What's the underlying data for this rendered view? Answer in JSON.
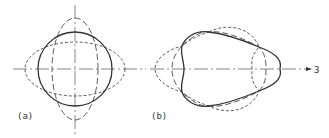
{
  "figure": {
    "colors": {
      "stroke": "#333333",
      "light_stroke": "#555555",
      "background": "#ffffff"
    },
    "panels": [
      {
        "id": "a",
        "label": "(a)",
        "description": "circle with orthogonal elliptical modes (mode 2)",
        "center": [
          75,
          69
        ]
      },
      {
        "id": "b",
        "label": "(b)",
        "description": "trilobe mode shape (mode 3)",
        "center": [
          230,
          69
        ]
      }
    ],
    "axis_label": "3"
  }
}
